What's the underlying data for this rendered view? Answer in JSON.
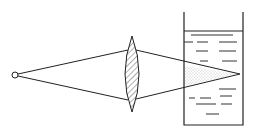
{
  "diagram": {
    "colors": {
      "line": "#222222",
      "background": "#ffffff",
      "stipple": "#888888"
    },
    "elements": [
      {
        "name": "point-source",
        "type": "small hollow circle",
        "x": 15,
        "y": 75
      },
      {
        "name": "convex-lens",
        "type": "biconvex lens with diagonal hatching",
        "cx": 132,
        "top": 36,
        "bottom": 112
      },
      {
        "name": "beaker",
        "type": "open-top container",
        "left": 184,
        "right": 243,
        "top": 12,
        "bottom": 125,
        "liquid_level": 31
      },
      {
        "name": "focus-point",
        "x": 240,
        "y": 74
      }
    ]
  }
}
